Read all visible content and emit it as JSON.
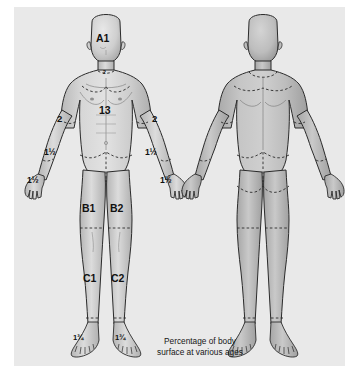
{
  "panel": {
    "background_color": "#e9e9e9",
    "page_background_color": "#ffffff"
  },
  "caption": {
    "text": "Percentage of body\nsurface at various ages"
  },
  "figures": {
    "anterior": {
      "name": "Anterior view",
      "labelled": true
    },
    "posterior": {
      "name": "Posterior view",
      "labelled": false
    }
  },
  "labels": {
    "head": "A1",
    "neck": "2",
    "trunk": "13",
    "upper_arm_left": "2",
    "upper_arm_right": "2",
    "forearm_left": "1½",
    "forearm_right": "1½",
    "hand_left": "1½",
    "hand_right": "1½",
    "thigh_left": "B1",
    "thigh_right": "B2",
    "lower_leg_left": "C1",
    "lower_leg_right": "C2",
    "foot_left": "1¾",
    "foot_right": "1¾"
  },
  "colors": {
    "body_fill": "#c9c9c9",
    "body_fill_light": "#dcdcdc",
    "body_fill_dark": "#b4b4b4",
    "outline": "#2b2b2b",
    "dashed": "#2b2b2b",
    "text": "#111111"
  }
}
